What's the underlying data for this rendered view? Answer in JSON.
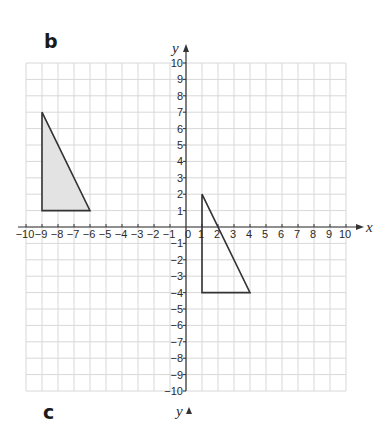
{
  "labels": {
    "part_b": "b",
    "part_c": "c"
  },
  "chart_data": {
    "type": "scatter",
    "title": "",
    "xlabel": "x",
    "ylabel": "y",
    "xlim": [
      -10,
      10
    ],
    "ylim": [
      -10,
      10
    ],
    "grid": true,
    "x_ticks": [
      -10,
      -9,
      -8,
      -7,
      -6,
      -5,
      -4,
      -3,
      -2,
      -1,
      0,
      1,
      2,
      3,
      4,
      5,
      6,
      7,
      8,
      9,
      10
    ],
    "y_ticks": [
      -10,
      -9,
      -8,
      -7,
      -6,
      -5,
      -4,
      -3,
      -2,
      -1,
      1,
      2,
      3,
      4,
      5,
      6,
      7,
      8,
      9,
      10
    ],
    "shapes": [
      {
        "name": "shaded-triangle",
        "fill": "#e3e3e3",
        "stroke": "#333333",
        "vertices": [
          [
            -9,
            7
          ],
          [
            -9,
            1
          ],
          [
            -6,
            1
          ]
        ]
      },
      {
        "name": "outline-triangle",
        "fill": "none",
        "stroke": "#333333",
        "vertices": [
          [
            1,
            2
          ],
          [
            1,
            -4
          ],
          [
            4,
            -4
          ]
        ]
      }
    ],
    "next_axis_label": "y"
  },
  "colors": {
    "grid": "#d8d8d8",
    "axis": "#333333",
    "shade": "#e3e3e3"
  }
}
